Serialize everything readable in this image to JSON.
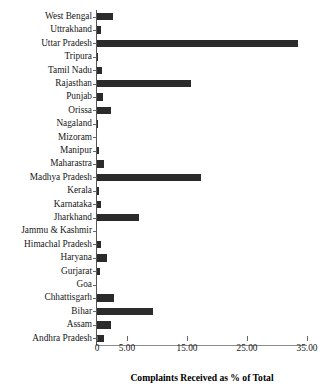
{
  "chart_data": {
    "type": "bar",
    "orientation": "horizontal",
    "title": "",
    "xlabel": "Complaints Received as % of Total",
    "ylabel": "",
    "xlim": [
      0,
      35
    ],
    "grid": false,
    "legend": null,
    "bar_color": "#2b2b2b",
    "xticks": [
      {
        "value": 0,
        "label": "0"
      },
      {
        "value": 5,
        "label": "5.00"
      },
      {
        "value": 15,
        "label": "15.00"
      },
      {
        "value": 25,
        "label": "25.00"
      },
      {
        "value": 35,
        "label": "35.00"
      }
    ],
    "categories": [
      "West Bengal",
      "Uttrakhand",
      "Uttar Pradesh",
      "Tripura",
      "Tamil Nadu",
      "Rajasthan",
      "Punjab",
      "Orissa",
      "Nagaland",
      "Mizoram",
      "Manipur",
      "Maharastra",
      "Madhya Pradesh",
      "Kerala",
      "Karnataka",
      "Jharkhand",
      "Jammu & Kashmir",
      "Himachal Pradesh",
      "Haryana",
      "Gurjarat",
      "Goa",
      "Chhattisgarh",
      "Bihar",
      "Assam",
      "Andhra Pradesh"
    ],
    "values": [
      2.7,
      0.7,
      33.5,
      0.2,
      0.9,
      15.6,
      1.0,
      2.4,
      0.15,
      0.0,
      0.3,
      1.1,
      17.3,
      0.25,
      0.7,
      7.0,
      0.0,
      0.7,
      1.7,
      0.5,
      0.0,
      2.9,
      9.4,
      2.3,
      1.1
    ]
  }
}
